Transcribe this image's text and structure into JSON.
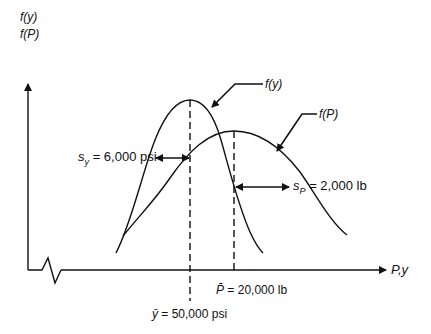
{
  "diagram": {
    "type": "probability-density-overlap",
    "y_axis": {
      "labels": [
        "f(y)",
        "f(P)"
      ]
    },
    "x_axis": {
      "label": "P,y"
    },
    "curves": [
      {
        "name": "f(y)",
        "label": "f(y)",
        "mean_label_symbol": "ȳ",
        "mean_label_text": "= 50,000 psi",
        "std_label_symbol": "s",
        "std_label_sub": "y",
        "std_label_text": "= 6,000 psi"
      },
      {
        "name": "f(P)",
        "label": "f(P)",
        "mean_label_symbol": "P̄",
        "mean_label_text": "= 20,000 lb",
        "std_label_symbol": "s",
        "std_label_sub": "P",
        "std_label_text": "= 2,000 lb"
      }
    ]
  },
  "colors": {
    "line": "#111111",
    "background": "#ffffff"
  }
}
